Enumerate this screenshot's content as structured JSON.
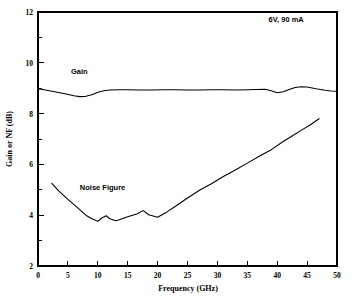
{
  "chart_data": {
    "type": "line",
    "title": "",
    "xlabel": "Frequency (GHz)",
    "ylabel": "Gain or NF (dB)",
    "xlim": [
      0,
      50
    ],
    "ylim": [
      2,
      12
    ],
    "xticks": [
      0,
      5,
      10,
      15,
      20,
      25,
      30,
      35,
      40,
      45,
      50
    ],
    "xtick_labels": [
      "0",
      "5",
      "10",
      "15",
      "20",
      "25",
      "30",
      "35",
      "40",
      "45",
      "50"
    ],
    "yticks": [
      2,
      4,
      6,
      8,
      10,
      12
    ],
    "ytick_labels": [
      "2",
      "4",
      "6",
      "8",
      "10",
      "12"
    ],
    "yticks_minor": [
      3,
      5,
      7,
      9,
      11
    ],
    "grid": false,
    "legend_position": "inline-annotations",
    "annotations": [
      {
        "text": "6V, 90 mA",
        "x": 41.5,
        "y": 11.6
      }
    ],
    "series": [
      {
        "name": "Gain",
        "label_text": "Gain",
        "label_x": 5.5,
        "label_y": 9.55,
        "x": [
          0.0,
          1.5,
          3.0,
          4.5,
          6.0,
          7.0,
          8.0,
          9.0,
          10.0,
          11.0,
          12.0,
          13.5,
          15.0,
          17.0,
          19.0,
          21.0,
          23.0,
          25.0,
          27.0,
          29.0,
          31.0,
          33.0,
          35.0,
          36.5,
          38.0,
          39.0,
          40.0,
          41.0,
          42.0,
          43.0,
          44.0,
          45.0,
          46.5,
          48.0,
          49.0,
          50.0
        ],
        "y": [
          8.98,
          8.92,
          8.85,
          8.78,
          8.7,
          8.67,
          8.68,
          8.74,
          8.84,
          8.9,
          8.93,
          8.94,
          8.94,
          8.93,
          8.93,
          8.94,
          8.94,
          8.93,
          8.93,
          8.94,
          8.94,
          8.93,
          8.94,
          8.95,
          8.96,
          8.9,
          8.82,
          8.86,
          8.95,
          9.03,
          9.06,
          9.05,
          8.98,
          8.92,
          8.89,
          8.88
        ]
      },
      {
        "name": "Noise Figure",
        "label_text": "Noise Figure",
        "label_x": 7.0,
        "label_y": 5.0,
        "x": [
          2.3,
          3.5,
          5.0,
          6.5,
          8.0,
          9.0,
          10.0,
          10.6,
          11.4,
          12.0,
          13.0,
          13.6,
          15.0,
          16.5,
          17.6,
          18.5,
          20.0,
          21.5,
          23.0,
          25.0,
          27.0,
          29.0,
          31.0,
          33.0,
          35.0,
          37.0,
          39.0,
          41.0,
          42.5,
          44.0,
          45.5,
          47.0
        ],
        "y": [
          5.25,
          4.95,
          4.62,
          4.32,
          4.0,
          3.86,
          3.76,
          3.88,
          3.98,
          3.86,
          3.78,
          3.82,
          3.94,
          4.05,
          4.18,
          4.02,
          3.92,
          4.12,
          4.35,
          4.68,
          4.98,
          5.24,
          5.52,
          5.78,
          6.05,
          6.32,
          6.58,
          6.9,
          7.12,
          7.34,
          7.55,
          7.8
        ]
      }
    ]
  },
  "axes": {
    "x_title": "Frequency (GHz)",
    "y_title": "Gain or NF (dB)"
  },
  "colors": {
    "background": "#ffffff",
    "foreground": "#000000",
    "curve": "#000000"
  }
}
